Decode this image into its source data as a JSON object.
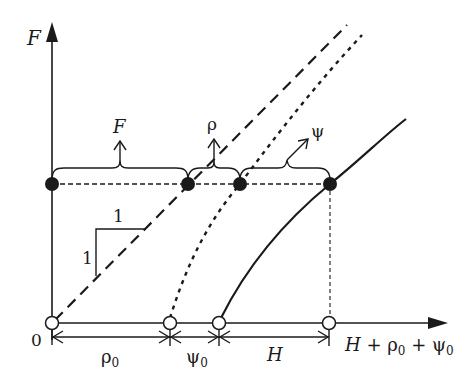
{
  "diagram": {
    "type": "force-displacement diagram",
    "colors": {
      "ink": "#1a1a1a",
      "background": "#ffffff"
    },
    "axes": {
      "y_label": "F",
      "x_label": "H + ρ0 + ψ0",
      "origin_label": "0"
    },
    "slope_triangle": {
      "horizontal_label": "1",
      "vertical_label": "1"
    },
    "braces": [
      {
        "label": "F",
        "from": "origin",
        "to": "dashed-line point"
      },
      {
        "label": "ρ",
        "from": "dashed-line point",
        "to": "dotted-line point"
      },
      {
        "label": "ψ",
        "from": "dotted-line point",
        "to": "solid-curve point"
      }
    ],
    "dimensions": [
      {
        "label": "ρ",
        "subscript": "0"
      },
      {
        "label": "ψ",
        "subscript": "0"
      },
      {
        "label": "H",
        "subscript": ""
      }
    ],
    "curves": [
      {
        "name": "linear reference",
        "style": "dashed"
      },
      {
        "name": "ρ-offset curve",
        "style": "dotted"
      },
      {
        "name": "response curve",
        "style": "solid"
      }
    ],
    "labels": {
      "F_brace": "F",
      "rho_brace": "ρ",
      "psi_brace": "ψ",
      "rho0": "ρ",
      "rho0_sub": "0",
      "psi0": "ψ",
      "psi0_sub": "0",
      "H_dim": "H",
      "x_axis_H": "H",
      "x_axis_plus1": " + ρ",
      "x_axis_sub1": "0",
      "x_axis_plus2": " + ψ",
      "x_axis_sub2": "0",
      "y_axis": "F",
      "origin": "0",
      "slope_h": "1",
      "slope_v": "1"
    }
  }
}
